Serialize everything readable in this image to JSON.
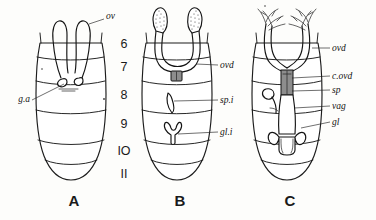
{
  "figure": {
    "background_color": "#fdfdfb",
    "ink_color": "#1a1a1a",
    "width": 376,
    "height": 220
  },
  "panels": [
    {
      "id": "A",
      "letter": "A",
      "caption": "A",
      "description": "Young nymph abdomen with rudimentary ovaries and genital appendages",
      "labels": [
        {
          "key": "ov",
          "text": "ov",
          "meaning": "ovary",
          "side": "right"
        },
        {
          "key": "ga",
          "text": "g.a",
          "meaning": "genital appendage",
          "side": "left"
        }
      ]
    },
    {
      "id": "B",
      "letter": "B",
      "caption": "B",
      "description": "Older nymph abdomen with developing oviducts, spermathecal invagination and gland invagination",
      "labels": [
        {
          "key": "ovd",
          "text": "ovd",
          "meaning": "oviduct",
          "side": "right"
        },
        {
          "key": "spi",
          "text": "sp.i",
          "meaning": "spermathecal invagination",
          "side": "right"
        },
        {
          "key": "gli",
          "text": "gl.i",
          "meaning": "gland invagination",
          "side": "right"
        }
      ]
    },
    {
      "id": "C",
      "letter": "C",
      "caption": "C",
      "description": "Adult abdomen with fully formed ovarioles, common oviduct, spermatheca, vagina and accessory glands",
      "labels": [
        {
          "key": "ovd",
          "text": "ovd",
          "meaning": "oviduct",
          "side": "right"
        },
        {
          "key": "covd",
          "text": "c.ovd",
          "meaning": "common oviduct",
          "side": "right"
        },
        {
          "key": "sp",
          "text": "sp",
          "meaning": "spermatheca",
          "side": "right"
        },
        {
          "key": "vag",
          "text": "vag",
          "meaning": "vagina",
          "side": "right"
        },
        {
          "key": "gl",
          "text": "gl",
          "meaning": "accessory gland",
          "side": "right"
        }
      ]
    }
  ],
  "segment_numbers": {
    "column_label": "abdominal segments",
    "items": [
      "6",
      "7",
      "8",
      "9",
      "IO",
      "II"
    ]
  }
}
